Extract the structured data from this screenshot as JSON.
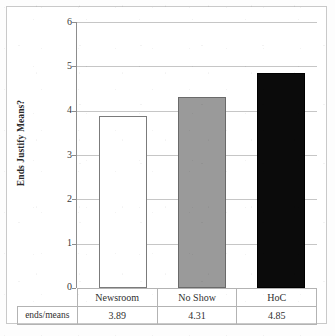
{
  "chart_data": {
    "type": "bar",
    "title": "",
    "subtitle": "",
    "xlabel": "",
    "ylabel": "Ends Justify Means?",
    "ylim": [
      0,
      6
    ],
    "yticks": [
      0,
      1,
      2,
      3,
      4,
      5,
      6
    ],
    "ytick_labels": [
      "0",
      "1",
      "2",
      "3",
      "4",
      "5",
      "6"
    ],
    "grid": true,
    "legend": false,
    "legend_position": "none",
    "categories": [
      "Newsroom",
      "No Show",
      "HoC"
    ],
    "values": [
      3.89,
      4.31,
      4.85
    ],
    "series": [
      {
        "name": "ends/means",
        "values": [
          3.89,
          4.31,
          4.85
        ]
      }
    ],
    "bar_colors": [
      "#ffffff",
      "#9a9a9a",
      "#0b0b0b"
    ],
    "bar_border_colors": [
      "#7b7b7b",
      "#6a6a6a",
      "#000000"
    ],
    "annotations": []
  },
  "axis": {
    "y_title": "Ends Justify Means?",
    "ticks": [
      {
        "label": "6",
        "value": 6
      },
      {
        "label": "5",
        "value": 5
      },
      {
        "label": "4",
        "value": 4
      },
      {
        "label": "3",
        "value": 3
      },
      {
        "label": "2",
        "value": 2
      },
      {
        "label": "1",
        "value": 1
      },
      {
        "label": "0",
        "value": 0
      }
    ]
  },
  "data_table": {
    "corner_label": "",
    "row_label": "ends/means",
    "columns": [
      "Newsroom",
      "No Show",
      "HoC"
    ],
    "values": [
      "3.89",
      "4.31",
      "4.85"
    ]
  },
  "colors": {
    "gridline": "#c6c6c6",
    "axis": "#8d8d8d",
    "text": "#2b2b2b",
    "bar_white": "#ffffff",
    "bar_gray": "#9a9a9a",
    "bar_black": "#0b0b0b",
    "table_border": "#b3b3b3",
    "frame": "#c9c9c9"
  }
}
